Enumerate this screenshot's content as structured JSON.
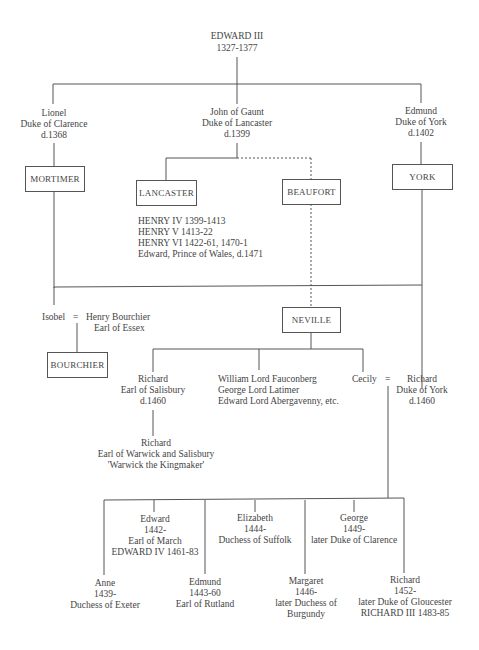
{
  "root": {
    "name": "EDWARD III",
    "dates": "1327-1377"
  },
  "sons": [
    {
      "name": "Lionel",
      "title": "Duke of Clarence",
      "death": "d.1368"
    },
    {
      "name": "John of Gaunt",
      "title": "Duke of Lancaster",
      "death": "d.1399"
    },
    {
      "name": "Edmund",
      "title": "Duke of York",
      "death": "d.1402"
    }
  ],
  "houses": {
    "mortimer": "MORTIMER",
    "lancaster": "LANCASTER",
    "beaufort": "BEAUFORT",
    "york": "YORK",
    "neville": "NEVILLE",
    "bourchier": "BOURCHIER"
  },
  "lancaster_kings": [
    "HENRY IV 1399-1413",
    "HENRY V 1413-22",
    "HENRY VI 1422-61, 1470-1",
    "Edward, Prince of Wales, d.1471"
  ],
  "isobel": {
    "name": "Isobel",
    "eq": "=",
    "spouse": "Henry Bourchier",
    "spouse_title": "Earl of Essex"
  },
  "neville_children": {
    "salisbury": {
      "name": "Richard",
      "title": "Earl of Salisbury",
      "death": "d.1460"
    },
    "others": [
      "William Lord Fauconberg",
      "George Lord Latimer",
      "Edward Lord Abergavenny, etc."
    ],
    "cecily": "Cecily",
    "eq": "="
  },
  "richard_york": {
    "name": "Richard",
    "title": "Duke of York",
    "death": "d.1460"
  },
  "warwick": {
    "name": "Richard",
    "title": "Earl of Warwick and Salisbury",
    "nickname": "'Warwick the Kingmaker'"
  },
  "york_children": [
    {
      "lines": [
        "Anne",
        "1439-",
        "Duchess of Exeter"
      ]
    },
    {
      "lines": [
        "Edward",
        "1442-",
        "Earl of March",
        "EDWARD IV 1461-83"
      ]
    },
    {
      "lines": [
        "Edmund",
        "1443-60",
        "Earl of Rutland"
      ]
    },
    {
      "lines": [
        "Elizabeth",
        "1444-",
        "Duchess of Suffolk"
      ]
    },
    {
      "lines": [
        "Margaret",
        "1446-",
        "later Duchess of",
        "Burgundy"
      ]
    },
    {
      "lines": [
        "George",
        "1449-",
        "later Duke of Clarence"
      ]
    },
    {
      "lines": [
        "Richard",
        "1452-",
        "later Duke of Gloucester",
        "RICHARD III 1483-85"
      ]
    }
  ],
  "colors": {
    "line": "#555555",
    "text": "#444444"
  }
}
